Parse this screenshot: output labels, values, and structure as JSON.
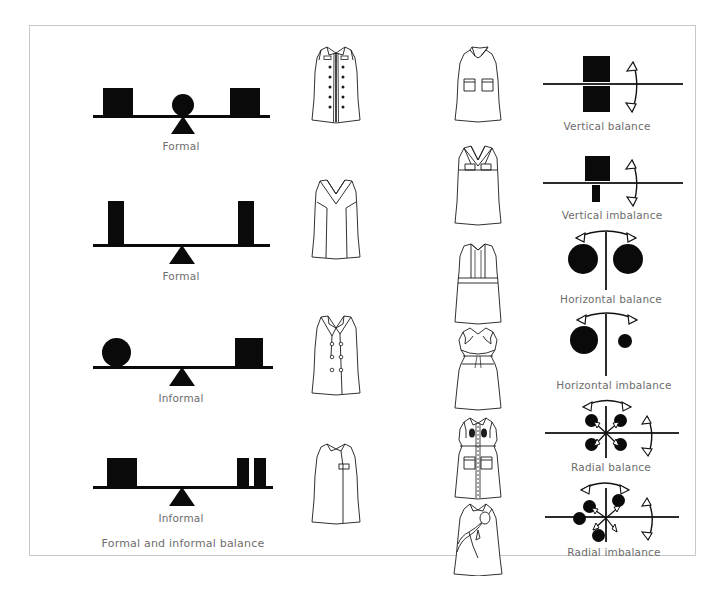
{
  "figure": {
    "title": "Formal and informal balance",
    "background_color": "#ffffff",
    "frame_color": "#c9c9c9",
    "ink_color": "#0a0a0a",
    "caption_color": "#6d6d6d"
  },
  "balance_scales": {
    "section_caption": "Formal and informal balance",
    "items": [
      {
        "label": "Formal",
        "description": "Beam with equal square weights at both ends, circle and triangle fulcrum at center",
        "left_weight": "square",
        "right_weight": "square",
        "fulcrum": "circle-and-triangle",
        "state": "level"
      },
      {
        "label": "Formal",
        "description": "Beam with equal tall narrow bars at both ends, triangle fulcrum at center",
        "left_weight": "tall-bar",
        "right_weight": "tall-bar",
        "fulcrum": "triangle",
        "state": "level"
      },
      {
        "label": "Informal",
        "description": "Beam with circle at left and square at right, triangle fulcrum off center",
        "left_weight": "circle",
        "right_weight": "square",
        "fulcrum": "triangle",
        "state": "level"
      },
      {
        "label": "Informal",
        "description": "Beam with square at left and two narrow bars at right, triangle fulcrum off center",
        "left_weight": "square",
        "right_weight": "double-bar",
        "fulcrum": "triangle",
        "state": "level"
      }
    ]
  },
  "dress_column_a": {
    "description": "Technical flat sketches of sheath dresses",
    "items": [
      {
        "name": "center-front-zip-dress",
        "detail": "sleeveless sheath with center front zipper and button trim rows"
      },
      {
        "name": "crossover-bodice-dress",
        "detail": "sleeveless sheath with crossed surplice bodice and princess seams"
      },
      {
        "name": "double-breasted-dress",
        "detail": "sleeveless notched-lapel dress with double-breasted buttons"
      },
      {
        "name": "asymmetric-buckle-dress",
        "detail": "sleeveless sheath with asymmetric seam and side buckle"
      }
    ]
  },
  "dress_column_b": {
    "description": "Technical flat sketches of dresses with collars and pockets",
    "items": [
      {
        "name": "collared-pocket-dress",
        "detail": "sleeveless dress with pointed collar and two patch pockets"
      },
      {
        "name": "crossed-strap-dress",
        "detail": "dress with crossed straps and tab details at bodice"
      },
      {
        "name": "pleated-bib-dress",
        "detail": "dress with bib front, waistband and gathered skirt"
      },
      {
        "name": "ruffle-yoke-dress",
        "detail": "dress with ruffled yoke, waist seam and straight skirt"
      },
      {
        "name": "pocket-front-shirtdress",
        "detail": "shirtdress with center placket, flap pockets and waist seam"
      },
      {
        "name": "asymmetric-drape-dress",
        "detail": "dress with asymmetric draped overlay and pocket"
      }
    ]
  },
  "balance_principles": {
    "items": [
      {
        "label": "Vertical balance",
        "axis": "horizontal",
        "shapes": "two equal squares above and below the horizontal axis",
        "arrow": "double-headed curved arrow, vertical"
      },
      {
        "label": "Vertical imbalance",
        "axis": "horizontal",
        "shapes": "large square above and small narrow bar below the horizontal axis",
        "arrow": "double-headed curved arrow, vertical"
      },
      {
        "label": "Horizontal balance",
        "axis": "vertical",
        "shapes": "two equal circles left and right of the vertical axis",
        "arrow": "double-headed curved arrow, horizontal"
      },
      {
        "label": "Horizontal imbalance",
        "axis": "vertical",
        "shapes": "large circle left and small circle right of the vertical axis",
        "arrow": "double-headed curved arrow, horizontal"
      },
      {
        "label": "Radial balance",
        "axis": "cross",
        "shapes": "four evenly spaced circles around a center point with radiating arrows",
        "arrow": "double-headed curved arrows, horizontal and vertical"
      },
      {
        "label": "Radial imbalance",
        "axis": "cross",
        "shapes": "four unevenly spaced circles around a center point with radiating arrows",
        "arrow": "double-headed curved arrows, horizontal and vertical"
      }
    ]
  }
}
